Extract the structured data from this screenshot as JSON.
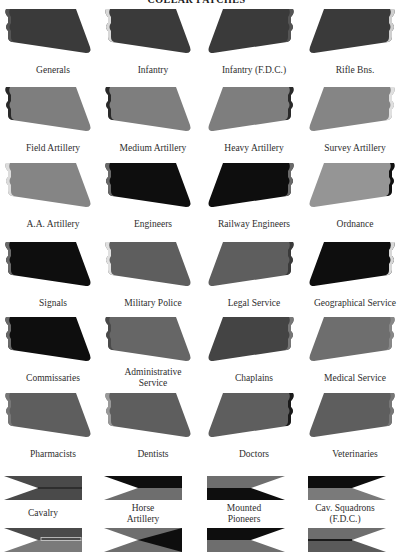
{
  "title": "COLLAR PATCHES",
  "colors": {
    "black": "#111111",
    "dark": "#3b3b3b",
    "mid": "#5a5a5a",
    "light": "#808080",
    "lighter": "#9a9a9a",
    "edge_light": "#d8d8d8"
  },
  "rows_top": [
    9,
    87,
    163,
    242,
    317,
    393
  ],
  "columns_left": [
    4,
    104,
    205,
    306
  ],
  "patches": [
    {
      "label": "Generals",
      "row": 0,
      "col": 0,
      "fill": "#3a3a3a",
      "edge": "#555555",
      "mirror": false
    },
    {
      "label": "Infantry",
      "row": 0,
      "col": 1,
      "fill": "#3a3a3a",
      "edge": "#d8d8d8",
      "mirror": false
    },
    {
      "label": "Infantry (F.D.C.)",
      "row": 0,
      "col": 2,
      "fill": "#3a3a3a",
      "edge": "#555555",
      "mirror": true
    },
    {
      "label": "Rifle Bns.",
      "row": 0,
      "col": 3,
      "fill": "#3a3a3a",
      "edge": "#cfcfcf",
      "mirror": true
    },
    {
      "label": "Field Artillery",
      "row": 1,
      "col": 0,
      "fill": "#7e7e7e",
      "edge": "#2a2a2a",
      "mirror": false
    },
    {
      "label": "Medium Artillery",
      "row": 1,
      "col": 1,
      "fill": "#7e7e7e",
      "edge": "#2a2a2a",
      "mirror": false
    },
    {
      "label": "Heavy Artillery",
      "row": 1,
      "col": 2,
      "fill": "#7e7e7e",
      "edge": "#2a2a2a",
      "mirror": true
    },
    {
      "label": "Survey Artillery",
      "row": 1,
      "col": 3,
      "fill": "#858585",
      "edge": "#e0e0e0",
      "mirror": true
    },
    {
      "label": "A.A. Artillery",
      "row": 2,
      "col": 0,
      "fill": "#858585",
      "edge": "#dcdcdc",
      "mirror": false
    },
    {
      "label": "Engineers",
      "row": 2,
      "col": 1,
      "fill": "#0e0e0e",
      "edge": "#6a6a6a",
      "mirror": false
    },
    {
      "label": "Railway Engineers",
      "row": 2,
      "col": 2,
      "fill": "#0e0e0e",
      "edge": "#6a6a6a",
      "mirror": true
    },
    {
      "label": "Ordnance",
      "row": 2,
      "col": 3,
      "fill": "#959595",
      "edge": "#111111",
      "mirror": true
    },
    {
      "label": "Signals",
      "row": 3,
      "col": 0,
      "fill": "#0e0e0e",
      "edge": "#6a6a6a",
      "mirror": false
    },
    {
      "label": "Military Police",
      "row": 3,
      "col": 1,
      "fill": "#5e5e5e",
      "edge": "#e0e0e0",
      "mirror": false
    },
    {
      "label": "Legal Service",
      "row": 3,
      "col": 2,
      "fill": "#5e5e5e",
      "edge": "#3a3a3a",
      "mirror": true
    },
    {
      "label": "Geographical Service",
      "row": 3,
      "col": 3,
      "fill": "#0e0e0e",
      "edge": "#d8d8d8",
      "mirror": true
    },
    {
      "label": "Commissaries",
      "row": 4,
      "col": 0,
      "fill": "#0e0e0e",
      "edge": "#6a6a6a",
      "mirror": false
    },
    {
      "label": "Administrative Service",
      "row": 4,
      "col": 1,
      "fill": "#666666",
      "edge": "#4a4a4a",
      "mirror": false
    },
    {
      "label": "Chaplains",
      "row": 4,
      "col": 2,
      "fill": "#444444",
      "edge": "#777777",
      "mirror": true
    },
    {
      "label": "Medical Service",
      "row": 4,
      "col": 3,
      "fill": "#6e6e6e",
      "edge": "#888888",
      "mirror": true
    },
    {
      "label": "Pharmacists",
      "row": 5,
      "col": 0,
      "fill": "#5e5e5e",
      "edge": "#777777",
      "mirror": false
    },
    {
      "label": "Dentists",
      "row": 5,
      "col": 1,
      "fill": "#5e5e5e",
      "edge": "#9a9a9a",
      "mirror": false
    },
    {
      "label": "Doctors",
      "row": 5,
      "col": 2,
      "fill": "#5e5e5e",
      "edge": "#1a1a1a",
      "mirror": true
    },
    {
      "label": "Veterinaries",
      "row": 5,
      "col": 3,
      "fill": "#5e5e5e",
      "edge": "#777777",
      "mirror": true
    }
  ],
  "pennants": [
    {
      "label": "Cavalry",
      "col": 0,
      "row": 0,
      "top": "#4a4a4a",
      "bottom": "#4a4a4a",
      "mirror": false,
      "stripe": "#2e2e2e"
    },
    {
      "label": "Horse Artillery",
      "col": 1,
      "row": 0,
      "top": "#0e0e0e",
      "bottom": "#6e6e6e",
      "mirror": false
    },
    {
      "label": "Mounted Pioneers",
      "col": 2,
      "row": 0,
      "top": "#6e6e6e",
      "bottom": "#0e0e0e",
      "mirror": true
    },
    {
      "label": "Cav. Squadrons (F.D.C.)",
      "col": 3,
      "row": 0,
      "top": "#0e0e0e",
      "bottom": "#7a7a7a",
      "mirror": true
    },
    {
      "label": "",
      "col": 0,
      "row": 1,
      "top": "#4a4a4a",
      "bottom": "#7a7a7a",
      "mirror": false,
      "box": "#cfcfcf"
    },
    {
      "label": "",
      "col": 1,
      "row": 1,
      "top": "#6e6e6e",
      "bottom": "#6e6e6e",
      "mirror": false,
      "triangle": "#0e0e0e"
    },
    {
      "label": "",
      "col": 2,
      "row": 1,
      "top": "#0e0e0e",
      "bottom": "#6e6e6e",
      "mirror": true
    },
    {
      "label": "",
      "col": 3,
      "row": 1,
      "top": "#6e6e6e",
      "bottom": "#5a5a5a",
      "mirror": true,
      "stripe": "#1a1a1a"
    }
  ],
  "pennant_rows_top": [
    476,
    528
  ],
  "pennant_label_lines": [
    [
      "Cavalry"
    ],
    [
      "Horse",
      "Artillery"
    ],
    [
      "Mounted",
      "Pioneers"
    ],
    [
      "Cav. Squadrons",
      "(F.D.C.)"
    ]
  ],
  "patch_label_lines": {
    "Administrative Service": [
      "Administrative",
      "Service"
    ]
  }
}
